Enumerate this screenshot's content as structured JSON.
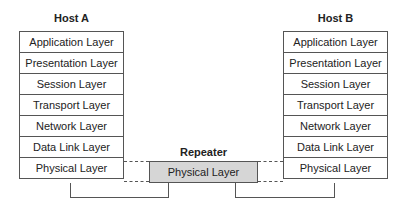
{
  "hostA": {
    "title": "Host A",
    "layers": [
      "Application Layer",
      "Presentation Layer",
      "Session Layer",
      "Transport Layer",
      "Network Layer",
      "Data Link Layer",
      "Physical Layer"
    ]
  },
  "hostB": {
    "title": "Host B",
    "layers": [
      "Application Layer",
      "Presentation Layer",
      "Session Layer",
      "Transport Layer",
      "Network Layer",
      "Data Link Layer",
      "Physical Layer"
    ]
  },
  "repeater": {
    "title": "Repeater",
    "layer": "Physical Layer"
  }
}
